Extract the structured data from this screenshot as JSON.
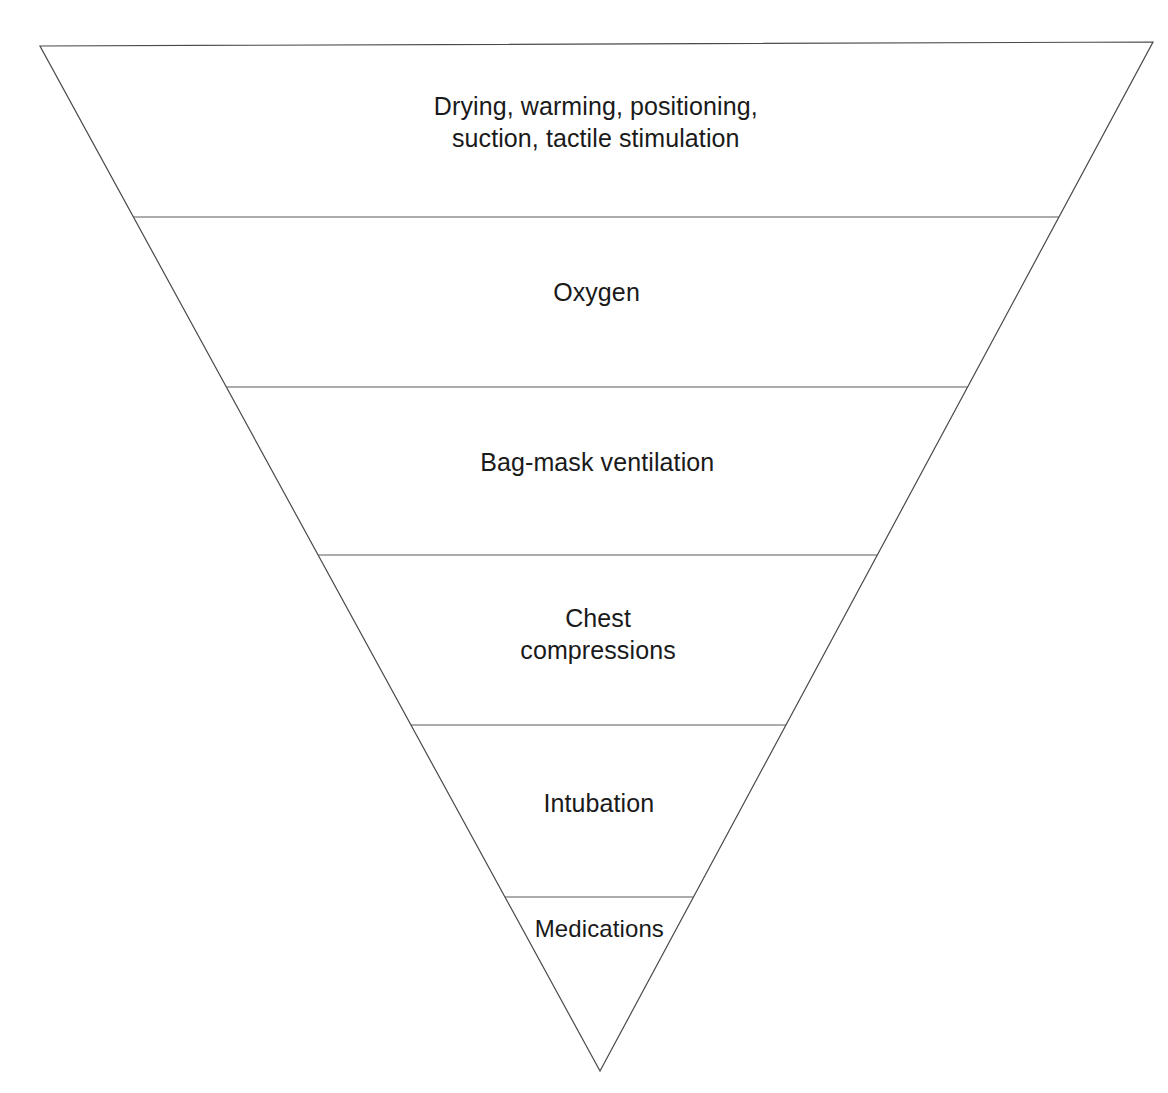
{
  "diagram": {
    "type": "inverted-pyramid",
    "background_color": "#ffffff",
    "outline_color": "#4a4a4a",
    "divider_color": "#5a5a5a",
    "text_color": "#1a1a1a",
    "geometry": {
      "top_left_x": 40,
      "top_left_y": 46,
      "top_right_x": 1153,
      "top_right_y": 42,
      "apex_x": 600,
      "apex_y": 1071
    },
    "levels": [
      {
        "id": "level-1",
        "label": "Drying, warming, positioning,\nsuction, tactile stimulation",
        "divider_y": 217,
        "label_center_y": 122
      },
      {
        "id": "level-2",
        "label": "Oxygen",
        "divider_y": 387,
        "label_center_y": 292
      },
      {
        "id": "level-3",
        "label": "Bag-mask ventilation",
        "divider_y": 555,
        "label_center_y": 462
      },
      {
        "id": "level-4",
        "label": "Chest\ncompressions",
        "divider_y": 725,
        "label_center_y": 634
      },
      {
        "id": "level-5",
        "label": "Intubation",
        "divider_y": 897,
        "label_center_y": 803
      },
      {
        "id": "level-6",
        "label": "Medications",
        "divider_y": null,
        "label_center_y": 929
      }
    ]
  }
}
